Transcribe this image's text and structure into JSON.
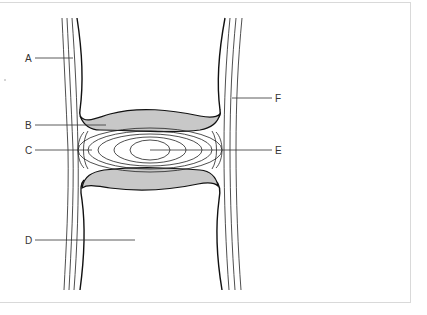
{
  "diagram": {
    "type": "anatomical cross-section (intervertebral disc between two vertebrae)",
    "labels": [
      {
        "id": "A",
        "text": "A",
        "side": "left"
      },
      {
        "id": "B",
        "text": "B",
        "side": "left"
      },
      {
        "id": "C",
        "text": "C",
        "side": "left"
      },
      {
        "id": "D",
        "text": "D",
        "side": "left"
      },
      {
        "id": "E",
        "text": "E",
        "side": "right"
      },
      {
        "id": "F",
        "text": "F",
        "side": "right"
      }
    ],
    "colors": {
      "line": "#222222",
      "endplate_fill": "#c8c8c8",
      "background": "#ffffff",
      "frame": "#d9d9d9"
    }
  }
}
